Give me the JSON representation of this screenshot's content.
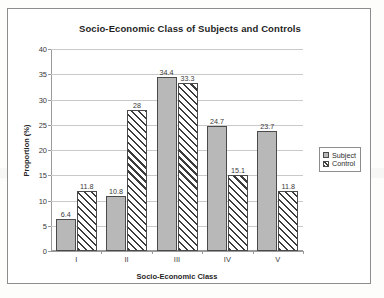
{
  "chart_data": {
    "type": "bar",
    "title": "Socio-Economic Class of Subjects and Controls",
    "xlabel": "Socio-Economic Class",
    "ylabel": "Proportion (%)",
    "categories": [
      "I",
      "II",
      "III",
      "IV",
      "V"
    ],
    "series": [
      {
        "name": "Subject",
        "values": [
          6.4,
          10.8,
          34.4,
          24.7,
          23.7
        ],
        "value_labels": [
          "6.4",
          "10.8",
          "34.4",
          "24.7",
          "23.7"
        ],
        "fill": "solid-gray",
        "color": "#b8b8b8"
      },
      {
        "name": "Control",
        "values": [
          11.8,
          28,
          33.3,
          15.1,
          11.8
        ],
        "value_labels": [
          "11.8",
          "28",
          "33.3",
          "15.1",
          "11.8"
        ],
        "fill": "diagonal-hatch",
        "color": "#ffffff"
      }
    ],
    "ylim": [
      0,
      40
    ],
    "ytick_step": 5,
    "yticks": [
      0,
      5,
      10,
      15,
      20,
      25,
      30,
      35,
      40
    ],
    "ytick_labels": [
      "0",
      "5",
      "10",
      "15",
      "20",
      "25",
      "30",
      "35",
      "40"
    ],
    "grid": true,
    "grid_axis": "y",
    "legend_position": "right",
    "data_labels": true
  },
  "legend": {
    "items": [
      {
        "label": "Subject",
        "swatch": "subject"
      },
      {
        "label": "Control",
        "swatch": "control"
      }
    ]
  },
  "colors": {
    "subject_fill": "#b8b8b8",
    "control_fill": "#ffffff",
    "bar_outline": "#4a4a4a",
    "gridline": "#c9c9c9",
    "axis": "#9a9a9a",
    "frame": "#8d8d8d",
    "text": "#2b2b2b",
    "page_background": "#fdfdfc"
  }
}
